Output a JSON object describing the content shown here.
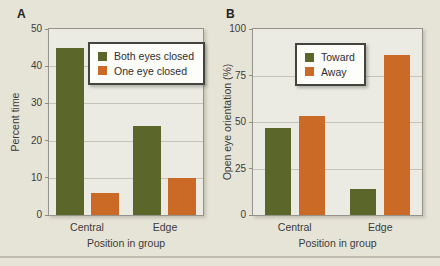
{
  "page": {
    "background": "#e6e4d6"
  },
  "colors": {
    "green": "#5b662a",
    "orange": "#cb6a27",
    "plot_background": "#ebeae3",
    "gridline": "#c6c4b9",
    "frame": "#95948c",
    "text": "#3b3b3b"
  },
  "chart_data": [
    {
      "type": "bar",
      "panel_label": "A",
      "ylabel": "Percent time",
      "xlabel": "Position in group",
      "ylim": [
        0,
        50
      ],
      "yticks": [
        0,
        10,
        20,
        30,
        40,
        50
      ],
      "categories": [
        "Central",
        "Edge"
      ],
      "grid": "horizontal",
      "legend_position": "top-right-inside",
      "series": [
        {
          "name": "Both eyes closed",
          "color": "#5b662a",
          "values": [
            45,
            24
          ]
        },
        {
          "name": "One eye closed",
          "color": "#cb6a27",
          "values": [
            6,
            10
          ]
        }
      ]
    },
    {
      "type": "bar",
      "panel_label": "B",
      "ylabel": "Open eye orientation (%)",
      "xlabel": "Position in group",
      "ylim": [
        0,
        100
      ],
      "yticks": [
        0,
        25,
        50,
        75,
        100
      ],
      "categories": [
        "Central",
        "Edge"
      ],
      "grid": "horizontal",
      "legend_position": "top-center-inside",
      "series": [
        {
          "name": "Toward",
          "color": "#5b662a",
          "values": [
            47,
            14
          ]
        },
        {
          "name": "Away",
          "color": "#cb6a27",
          "values": [
            53,
            86
          ]
        }
      ]
    }
  ]
}
